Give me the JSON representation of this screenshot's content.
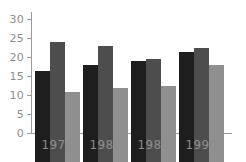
{
  "chart_data": {
    "type": "bar",
    "title": "",
    "subtitle": "",
    "xlabel": "",
    "ylabel": "",
    "categories": [
      "1975",
      "1980",
      "1985",
      "1990"
    ],
    "series": [
      {
        "name": "Series 1",
        "color": "#1e1e1e",
        "values": [
          24,
          25.5,
          26.5,
          29
        ]
      },
      {
        "name": "Series 2",
        "color": "#4d4d4d",
        "values": [
          31.5,
          30.5,
          27,
          30
        ]
      },
      {
        "name": "Series 3",
        "color": "#8f8f8f",
        "values": [
          18.5,
          19.5,
          20,
          25.5
        ]
      }
    ],
    "ylim": [
      0,
      33
    ],
    "yticks": [
      0,
      5,
      10,
      15,
      20,
      25,
      30
    ],
    "ytick_labels": [
      "0",
      "5",
      "10",
      "15",
      "20",
      "25",
      "30"
    ],
    "grid": false,
    "legend": "none",
    "axis_color": "#9a9a9a",
    "tick_label_color": "#8d8d8d",
    "background": "#ffffff"
  },
  "axis": {
    "y_labels": {
      "t0": "0",
      "t5": "5",
      "t10": "10",
      "t15": "15",
      "t20": "20",
      "t25": "25",
      "t30": "30"
    },
    "x_labels": {
      "g0": "1975",
      "g1": "1980",
      "g2": "1985",
      "g3": "1990"
    }
  }
}
